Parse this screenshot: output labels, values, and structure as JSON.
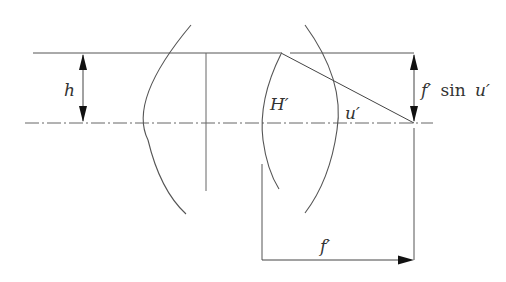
{
  "diagram": {
    "title": "",
    "colors": {
      "stroke": "#555555",
      "text": "#333333",
      "background": "#ffffff"
    },
    "labels": {
      "height": "h",
      "principal_plane": "H′",
      "angle": "u′",
      "image_height_f": "f′",
      "image_height_sin": "sin",
      "image_height_u": "u′",
      "focal_length": "f′"
    },
    "elements": [
      "incident-ray-height-h",
      "optical-axis",
      "lens-1",
      "lens-2",
      "principal-plane-H-prime",
      "refracted-ray",
      "focal-length-dimension"
    ]
  }
}
